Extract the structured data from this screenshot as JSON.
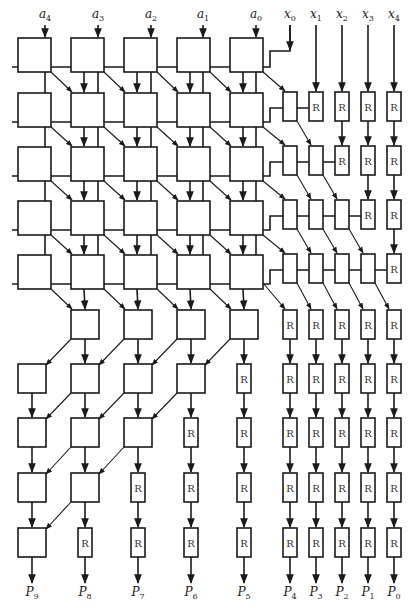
{
  "diagram": {
    "title": "",
    "register_label": "R",
    "colors": {
      "stroke": "#1a1a1a",
      "background": "#ffffff",
      "text": "#222222"
    },
    "inputs_top": [
      {
        "base": "a",
        "sub": "4",
        "x": 45
      },
      {
        "base": "a",
        "sub": "3",
        "x": 98
      },
      {
        "base": "a",
        "sub": "2",
        "x": 151
      },
      {
        "base": "a",
        "sub": "1",
        "x": 203
      },
      {
        "base": "a",
        "sub": "0",
        "x": 256
      },
      {
        "base": "x",
        "sub": "0",
        "x": 290
      },
      {
        "base": "x",
        "sub": "1",
        "x": 316
      },
      {
        "base": "x",
        "sub": "2",
        "x": 342
      },
      {
        "base": "x",
        "sub": "3",
        "x": 368
      },
      {
        "base": "x",
        "sub": "4",
        "x": 394
      }
    ],
    "outputs_bottom": [
      {
        "base": "P",
        "sub": "9",
        "x": 32
      },
      {
        "base": "P",
        "sub": "8",
        "x": 85
      },
      {
        "base": "P",
        "sub": "7",
        "x": 138
      },
      {
        "base": "P",
        "sub": "6",
        "x": 191
      },
      {
        "base": "P",
        "sub": "5",
        "x": 244
      },
      {
        "base": "P",
        "sub": "4",
        "x": 290
      },
      {
        "base": "P",
        "sub": "3",
        "x": 316
      },
      {
        "base": "P",
        "sub": "2",
        "x": 342
      },
      {
        "base": "P",
        "sub": "1",
        "x": 368
      },
      {
        "base": "P",
        "sub": "0",
        "x": 394
      }
    ],
    "grid": {
      "big_cols_x": [
        18,
        71,
        124,
        177,
        230
      ],
      "big_w": 33,
      "big_h": 34,
      "big_rows_y": [
        38,
        93,
        147,
        201,
        255
      ],
      "bus_offset": 29,
      "small_cols_x": [
        283,
        309,
        335,
        361,
        387
      ],
      "small_w": 14,
      "lower_rows_y": [
        310,
        364,
        418,
        473,
        528
      ],
      "lower_h": 29,
      "lower_box_w": 28,
      "label_y": 18,
      "output_label_y": 596
    }
  }
}
